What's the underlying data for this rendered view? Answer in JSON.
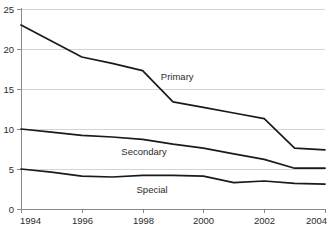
{
  "chart_data": {
    "type": "line",
    "title": "",
    "subtitle": "",
    "xlabel": "",
    "ylabel": "",
    "x": [
      1994,
      1995,
      1996,
      1997,
      1998,
      1999,
      2000,
      2001,
      2002,
      2003,
      2004
    ],
    "xlim": [
      1994,
      2004
    ],
    "ylim": [
      0,
      25
    ],
    "grid": true,
    "legend_position": "inline-labels",
    "x_tick_labels": [
      "1994",
      "1996",
      "1998",
      "2000",
      "2002",
      "2004"
    ],
    "x_tick_values": [
      1994,
      1996,
      1998,
      2000,
      2002,
      2004
    ],
    "y_tick_labels": [
      "0",
      "5",
      "10",
      "15",
      "20",
      "25"
    ],
    "y_tick_values": [
      0,
      5,
      10,
      15,
      20,
      25
    ],
    "series": [
      {
        "name": "Primary",
        "color": "#1a1a1a",
        "label_x": 1998.6,
        "label_y": 16.6,
        "values": [
          23.0,
          21.0,
          19.0,
          18.2,
          17.3,
          13.4,
          12.7,
          12.0,
          11.3,
          7.6,
          7.4
        ]
      },
      {
        "name": "Secondary",
        "color": "#1a1a1a",
        "label_x": 1997.3,
        "label_y": 7.2,
        "values": [
          10.0,
          9.6,
          9.2,
          9.0,
          8.7,
          8.1,
          7.6,
          6.9,
          6.2,
          5.1,
          5.1
        ]
      },
      {
        "name": "Special",
        "color": "#1a1a1a",
        "label_x": 1997.8,
        "label_y": 2.4,
        "values": [
          5.0,
          4.6,
          4.1,
          4.0,
          4.2,
          4.2,
          4.1,
          3.3,
          3.5,
          3.2,
          3.1
        ]
      }
    ]
  },
  "colors": {
    "line": "#1a1a1a",
    "grid": "#c9c9c9",
    "axis": "#8a8a8a",
    "text": "#2b2b2b",
    "background": "#ffffff"
  }
}
